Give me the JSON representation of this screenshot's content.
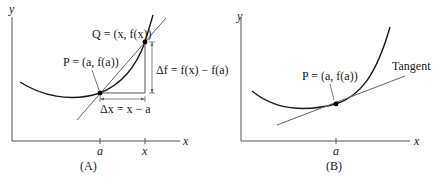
{
  "panels": [
    {
      "id": "A",
      "caption": "(A)",
      "axes": {
        "x_label": "x",
        "y_label": "y"
      },
      "ticks": [
        {
          "label": "a"
        },
        {
          "label": "x"
        }
      ],
      "points": {
        "P": {
          "label": "P = (a, f(a))"
        },
        "Q": {
          "label": "Q = (x, f(x))"
        }
      },
      "annotations": {
        "delta_x": "Δx = x − a",
        "delta_f": "Δf = f(x) − f(a)"
      },
      "lines": {
        "secant": "secant line through P and Q"
      }
    },
    {
      "id": "B",
      "caption": "(B)",
      "axes": {
        "x_label": "x",
        "y_label": "y"
      },
      "ticks": [
        {
          "label": "a"
        }
      ],
      "points": {
        "P": {
          "label": "P = (a, f(a))"
        }
      },
      "annotations": {
        "tangent": "Tangent"
      }
    }
  ],
  "colors": {
    "curve": "#1a1a1a",
    "axis": "#555555",
    "line": "#666666",
    "background": "#ffffff"
  }
}
